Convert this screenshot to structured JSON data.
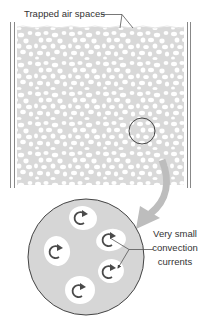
{
  "labels": {
    "trapped_air": "Trapped air spaces",
    "convection_line1": "Very small",
    "convection_line2": "convection",
    "convection_line3": "currents"
  },
  "colors": {
    "insulation_fill": "#d9d9d9",
    "air_pocket": "#ffffff",
    "wall_line": "#888888",
    "outline": "#444444",
    "arrow_fill": "#bdbdbd",
    "curl_arrow": "#4a4a4a",
    "text": "#333333"
  },
  "panels": {
    "top": "Wall cavity filled with insulation containing trapped air",
    "bottom": "Magnified view of insulation"
  },
  "magnified_air_pockets": [
    {
      "cx": 83,
      "cy": 218
    },
    {
      "cx": 57,
      "cy": 251
    },
    {
      "cx": 111,
      "cy": 240
    },
    {
      "cx": 110,
      "cy": 271
    },
    {
      "cx": 80,
      "cy": 290
    }
  ]
}
